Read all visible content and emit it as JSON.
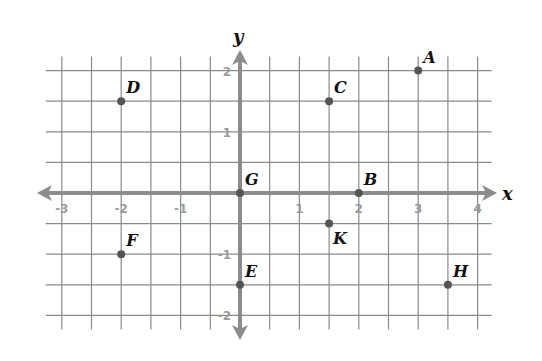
{
  "chart_data": {
    "type": "scatter",
    "title": "",
    "xlabel": "x",
    "ylabel": "y",
    "xlim": [
      -3.3,
      4.3
    ],
    "ylim": [
      -2.3,
      2.3
    ],
    "grid": true,
    "grid_step": 0.5,
    "x_ticks": [
      {
        "value": -3,
        "label": "-3"
      },
      {
        "value": -2,
        "label": "-2"
      },
      {
        "value": -1,
        "label": "-1"
      },
      {
        "value": 1,
        "label": "1"
      },
      {
        "value": 2,
        "label": "2"
      },
      {
        "value": 3,
        "label": "3"
      },
      {
        "value": 4,
        "label": "4"
      }
    ],
    "y_ticks": [
      {
        "value": 2,
        "label": "2"
      },
      {
        "value": 1,
        "label": "1"
      },
      {
        "value": -1,
        "label": "-1"
      },
      {
        "value": -2,
        "label": "-2"
      }
    ],
    "points": [
      {
        "label": "A",
        "x": 3,
        "y": 2
      },
      {
        "label": "B",
        "x": 2,
        "y": 0
      },
      {
        "label": "C",
        "x": 1.5,
        "y": 1.5
      },
      {
        "label": "D",
        "x": -2,
        "y": 1.5
      },
      {
        "label": "E",
        "x": 0,
        "y": -1.5
      },
      {
        "label": "F",
        "x": -2,
        "y": -1
      },
      {
        "label": "G",
        "x": 0,
        "y": 0
      },
      {
        "label": "H",
        "x": 3.5,
        "y": -1.5
      },
      {
        "label": "K",
        "x": 1.5,
        "y": -0.5
      }
    ]
  }
}
